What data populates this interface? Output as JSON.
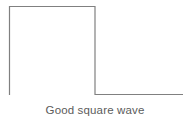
{
  "figure": {
    "caption": "Good square wave",
    "caption_color": "#5b5b5b",
    "background_color": "#ffffff",
    "trace_color": "#808080",
    "trace_width": 1.2
  },
  "chart_data": {
    "type": "line",
    "title": "Good square wave",
    "xlabel": "",
    "ylabel": "",
    "grid": false,
    "legend": false,
    "axes_visible": false,
    "xlim": [
      0,
      190
    ],
    "ylim": [
      0,
      100
    ],
    "series": [
      {
        "name": "square-wave-trace",
        "color": "#808080",
        "x": [
          9.5,
          9.5,
          95,
          95,
          183
        ],
        "y": [
          95,
          6.5,
          6.5,
          94.5,
          94.5
        ],
        "description": "Ideal square wave: flat high level, instantaneous vertical falling edge, flat low level with no overshoot, ringing or slope"
      }
    ],
    "annotations": [
      {
        "name": "caption",
        "text": "Good square wave",
        "x": 95,
        "y": 110
      }
    ]
  }
}
